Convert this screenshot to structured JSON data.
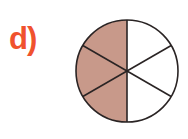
{
  "label": "d)",
  "colors": {
    "label": "#f0522e",
    "shaded": "#c8998a",
    "stroke": "#2a2424",
    "unshaded": "#ffffff"
  },
  "fraction": {
    "total_parts": 6,
    "shaded_parts": 3,
    "shaded_side": "left"
  },
  "circle": {
    "cx": 127,
    "cy": 71,
    "r": 51
  }
}
